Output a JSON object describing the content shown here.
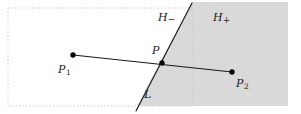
{
  "figure": {
    "type": "geometry-diagram",
    "canvas": {
      "width": 301,
      "height": 114,
      "background": "#ffffff"
    },
    "colors": {
      "shaded_halfplane": "#d9d9d9",
      "line": "#1a1a1a",
      "point": "#000000",
      "dotted_border": "#cccccc",
      "text": "#1a1a1a"
    },
    "bounding_box": {
      "x": 8,
      "y": 8,
      "width": 185,
      "height": 98,
      "style": "dotted"
    },
    "shaded_region": {
      "name": "H_plus",
      "polygon": "193,2 288,2 288,106 137,106 192,2",
      "fill": "#d9d9d9"
    },
    "separating_line": {
      "name": "L",
      "from": {
        "x": 192,
        "y": 3
      },
      "to": {
        "x": 136,
        "y": 111
      }
    },
    "segment": {
      "name": "P1P2",
      "from": {
        "x": 73,
        "y": 55
      },
      "to": {
        "x": 232,
        "y": 72
      }
    },
    "points": [
      {
        "id": "p1",
        "x": 73,
        "y": 55,
        "radius": 2.6
      },
      {
        "id": "p",
        "x": 162,
        "y": 63,
        "radius": 2.6
      },
      {
        "id": "p2",
        "x": 232,
        "y": 72,
        "radius": 2.6
      }
    ],
    "labels": {
      "h_minus": {
        "base": "H",
        "sign": "−",
        "x": 158,
        "y": 13
      },
      "h_plus": {
        "base": "H",
        "sign": "+",
        "x": 213,
        "y": 13
      },
      "p_intersection": {
        "base": "P",
        "x": 152,
        "y": 45
      },
      "p1": {
        "base": "P",
        "sub": "1",
        "x": 58,
        "y": 64
      },
      "p2": {
        "base": "P",
        "sub": "2",
        "x": 236,
        "y": 78
      },
      "line_l": {
        "base": "L",
        "x": 144,
        "y": 89
      }
    }
  }
}
